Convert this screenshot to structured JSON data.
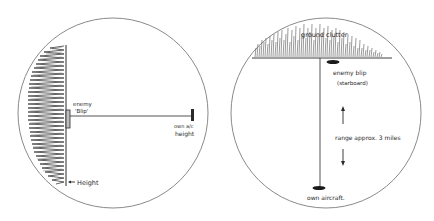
{
  "left_panel": {
    "labels": {
      "enemy_blip_line1": "enemy",
      "enemy_blip_line2": "'Blip'",
      "own_ac_line1": "own a/c",
      "own_ac_line2": "height",
      "height": "Height"
    }
  },
  "right_panel": {
    "labels": {
      "ground_clutter": "ground clutter",
      "enemy_blip_line1": "enemy blip",
      "enemy_blip_line2": "(starboard)",
      "range": "range approx. 3 miles",
      "own_aircraft": "own aircraft."
    }
  },
  "colors": {
    "ink": "#2a2a2a",
    "circle": "#8a8a8a",
    "background": "#ffffff"
  }
}
